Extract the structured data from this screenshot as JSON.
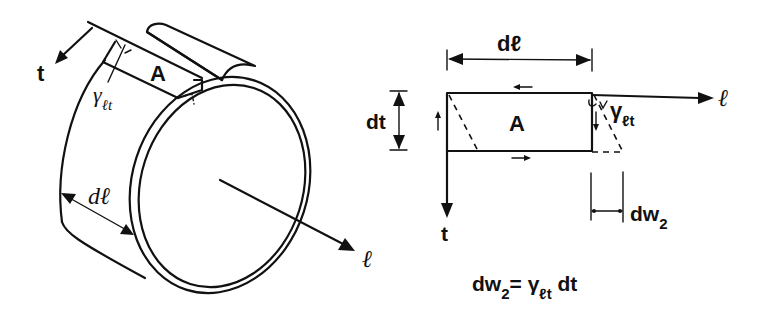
{
  "figure": {
    "left_panel": {
      "name": "thin-walled tube element",
      "labels": {
        "t_axis": "t",
        "element": "A",
        "shear_strain_symbol": "γ",
        "shear_strain_sub": "ℓt",
        "length_increment": "dℓ",
        "l_axis": "ℓ"
      }
    },
    "right_panel": {
      "name": "deformed element A",
      "labels": {
        "length_increment": "dℓ",
        "thickness_increment": "dt",
        "element": "A",
        "l_axis": "ℓ",
        "t_axis": "t",
        "shear_strain_symbol": "γ",
        "shear_strain_sub": "ℓt",
        "displacement": "dw",
        "displacement_sub": "2"
      }
    },
    "equation": {
      "lhs": "dw",
      "lhs_sub": "2",
      "equals": "=",
      "gamma": "γ",
      "gamma_sub": "ℓt",
      "rhs": "dt"
    },
    "colors": {
      "ink": "#111111",
      "background": "#ffffff"
    }
  }
}
